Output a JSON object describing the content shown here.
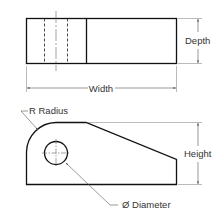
{
  "top_view": {
    "width_label": "Width",
    "depth_label": "Depth"
  },
  "front_view": {
    "height_label": "Height",
    "radius_label": "R Radius",
    "diameter_label": "Ø Diameter"
  },
  "colors": {
    "object_line": "#111111",
    "dimension_line": "#555555"
  }
}
